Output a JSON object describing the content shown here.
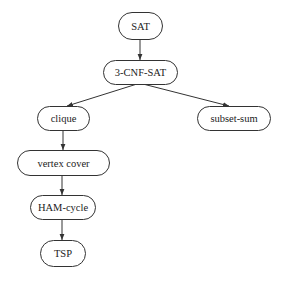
{
  "diagram": {
    "type": "directed-graph",
    "nodes": [
      {
        "id": "sat",
        "label": "SAT",
        "x": 118,
        "y": 12,
        "w": 44,
        "h": 27
      },
      {
        "id": "3cnfsat",
        "label": "3-CNF-SAT",
        "x": 103,
        "y": 60,
        "w": 74,
        "h": 24
      },
      {
        "id": "clique",
        "label": "clique",
        "x": 37,
        "y": 106,
        "w": 52,
        "h": 24
      },
      {
        "id": "subsetsum",
        "label": "subset-sum",
        "x": 197,
        "y": 106,
        "w": 73,
        "h": 24
      },
      {
        "id": "vertexcover",
        "label": "vertex cover",
        "x": 17,
        "y": 150,
        "w": 92,
        "h": 25
      },
      {
        "id": "hamcycle",
        "label": "HAM-cycle",
        "x": 30,
        "y": 195,
        "w": 65,
        "h": 24
      },
      {
        "id": "tsp",
        "label": "TSP",
        "x": 40,
        "y": 240,
        "w": 45,
        "h": 26
      }
    ],
    "edges": [
      {
        "from": "sat",
        "to": "3cnfsat",
        "x1": 140,
        "y1": 39,
        "x2": 140,
        "y2": 60
      },
      {
        "from": "3cnfsat",
        "to": "clique",
        "x1": 137,
        "y1": 84,
        "x2": 67,
        "y2": 106
      },
      {
        "from": "3cnfsat",
        "to": "subsetsum",
        "x1": 143,
        "y1": 84,
        "x2": 229,
        "y2": 106
      },
      {
        "from": "clique",
        "to": "vertexcover",
        "x1": 63,
        "y1": 130,
        "x2": 63,
        "y2": 150
      },
      {
        "from": "vertexcover",
        "to": "hamcycle",
        "x1": 62,
        "y1": 175,
        "x2": 62,
        "y2": 195
      },
      {
        "from": "hamcycle",
        "to": "tsp",
        "x1": 62,
        "y1": 219,
        "x2": 62,
        "y2": 240
      }
    ],
    "colors": {
      "stroke": "#333333",
      "text": "#222222",
      "background": "#ffffff"
    }
  }
}
